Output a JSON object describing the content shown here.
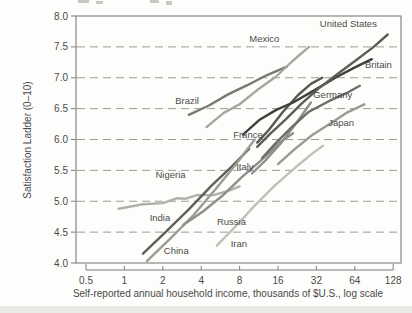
{
  "chart_data": {
    "type": "line",
    "title": "",
    "xlabel": "Self-reported annual household income, thousands of $U.S., log scale",
    "ylabel": "Satisfaction Ladder (0–10)",
    "x_scale": "log2",
    "xlim": [
      0.5,
      128
    ],
    "ylim": [
      4.0,
      8.0
    ],
    "grid": "horizontal dashed at each 0.5 from 4.5 to 7.5",
    "legend_position": "labels next to lines",
    "x_ticks": [
      0.5,
      1,
      2,
      4,
      8,
      16,
      32,
      64,
      128
    ],
    "x_tick_labels": [
      "0.5",
      "1",
      "2",
      "4",
      "8",
      "16",
      "32",
      "64",
      "128"
    ],
    "y_ticks": [
      8.0,
      7.5,
      7.0,
      6.5,
      6.0,
      5.5,
      5.0,
      4.5,
      4.0
    ],
    "y_tick_labels": [
      "8.0",
      "7.5",
      "7.0",
      "6.5",
      "6.0",
      "5.5",
      "5.0",
      "4.5",
      "4.0"
    ],
    "axis_text_color": "#4a4a48",
    "frame_color": "#7d7d7b",
    "grid_color": "#9a9a96",
    "series": [
      {
        "name": "Nigeria",
        "color": "#b0b0ac",
        "label_pos": [
          2.3,
          5.42
        ],
        "x": [
          0.9,
          1.4,
          2,
          2.6,
          3,
          3.7,
          5,
          6.5,
          8
        ],
        "y": [
          4.88,
          4.95,
          4.97,
          5.05,
          5.04,
          5.1,
          5.1,
          5.17,
          5.24
        ]
      },
      {
        "name": "India",
        "color": "#5f5f5b",
        "label_pos": [
          1.9,
          4.73
        ],
        "x": [
          1.4,
          2.1,
          3.2,
          4.8,
          7,
          9.5
        ],
        "y": [
          4.15,
          4.5,
          4.87,
          5.25,
          5.57,
          5.85
        ]
      },
      {
        "name": "China",
        "color": "#9b9b97",
        "label_pos": [
          2.55,
          4.2
        ],
        "x": [
          1.5,
          2.3,
          3.5,
          5.2,
          7.5,
          10.5
        ],
        "y": [
          4.03,
          4.4,
          4.78,
          5.2,
          5.6,
          6.0
        ]
      },
      {
        "name": "Russia",
        "color": "#8e8e8a",
        "label_pos": [
          6.9,
          4.67
        ],
        "x": [
          2.9,
          4.1,
          5.8,
          8.2,
          12,
          16.5,
          21
        ],
        "y": [
          4.62,
          4.83,
          5.08,
          5.38,
          5.68,
          5.95,
          6.1
        ]
      },
      {
        "name": "Iran",
        "color": "#bfbfbb",
        "label_pos": [
          7.9,
          4.3
        ],
        "x": [
          5.3,
          7.5,
          10.5,
          15,
          22,
          30,
          36
        ],
        "y": [
          4.28,
          4.6,
          4.93,
          5.25,
          5.55,
          5.78,
          5.9
        ]
      },
      {
        "name": "Brazil",
        "color": "#787874",
        "label_pos": [
          3.1,
          6.62
        ],
        "x": [
          3.2,
          4.6,
          6.5,
          9.2,
          13,
          18.8
        ],
        "y": [
          6.4,
          6.55,
          6.73,
          6.88,
          7.04,
          7.18
        ]
      },
      {
        "name": "Mexico",
        "color": "#a6a6a2",
        "label_pos": [
          12.5,
          7.62
        ],
        "x": [
          4.4,
          6,
          8,
          11,
          15.5,
          21,
          28
        ],
        "y": [
          6.2,
          6.43,
          6.57,
          6.8,
          7.02,
          7.28,
          7.5
        ]
      },
      {
        "name": "Italy",
        "color": "#8f8f8b",
        "label_pos": [
          8.8,
          5.56
        ],
        "x": [
          10,
          13,
          17,
          22.5,
          29
        ],
        "y": [
          5.45,
          5.68,
          5.95,
          6.28,
          6.6
        ]
      },
      {
        "name": "France",
        "color": "#565652",
        "label_pos": [
          9.3,
          6.07
        ],
        "x": [
          11,
          13.5,
          17.5,
          23,
          29,
          35.5
        ],
        "y": [
          5.95,
          6.15,
          6.45,
          6.72,
          6.9,
          7.0
        ]
      },
      {
        "name": "Germany",
        "color": "#6d6d69",
        "label_pos": [
          43,
          6.72
        ],
        "x": [
          12,
          15.5,
          20.5,
          28,
          40,
          55,
          70
        ],
        "y": [
          5.7,
          5.95,
          6.2,
          6.45,
          6.62,
          6.75,
          6.87
        ]
      },
      {
        "name": "Japan",
        "color": "#999995",
        "label_pos": [
          50,
          6.27
        ],
        "x": [
          16,
          21.5,
          29.5,
          42,
          56,
          76
        ],
        "y": [
          5.6,
          5.84,
          6.07,
          6.27,
          6.44,
          6.57
        ]
      },
      {
        "name": "Britain",
        "color": "#3f3f3b",
        "label_pos": [
          98,
          7.2
        ],
        "x": [
          8.5,
          11.5,
          15.5,
          21,
          31,
          45,
          63,
          87
        ],
        "y": [
          6.08,
          6.32,
          6.48,
          6.6,
          6.8,
          7.0,
          7.16,
          7.3
        ]
      },
      {
        "name": "United States",
        "color": "#5c5c58",
        "label_pos": [
          57,
          7.87
        ],
        "x": [
          11,
          14,
          18.5,
          24.5,
          33,
          46,
          65,
          90,
          116
        ],
        "y": [
          5.88,
          6.1,
          6.33,
          6.58,
          6.82,
          7.05,
          7.28,
          7.5,
          7.7
        ]
      }
    ]
  }
}
